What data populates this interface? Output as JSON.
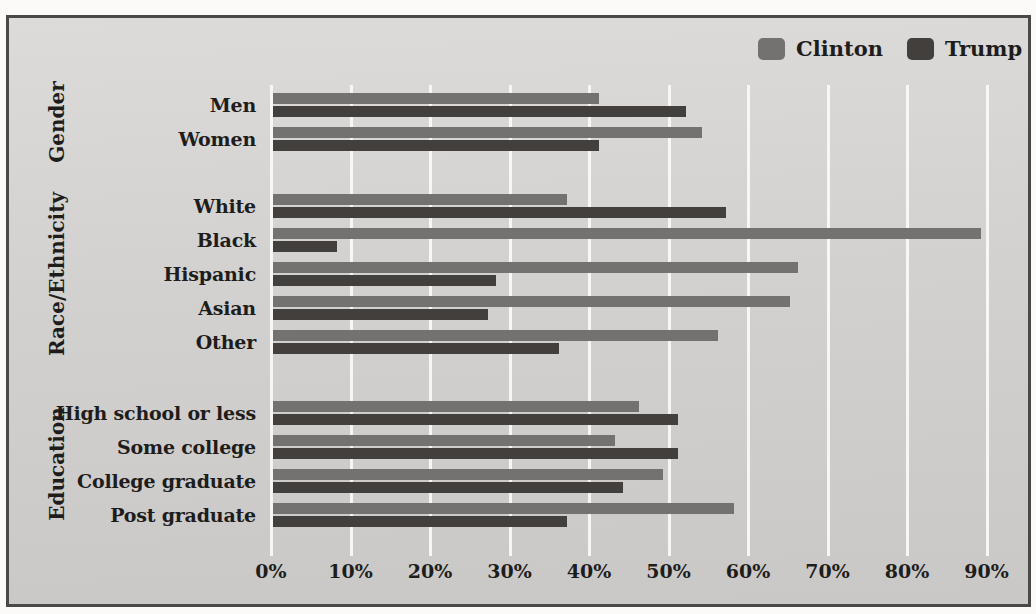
{
  "figure": {
    "legend": {
      "items": [
        {
          "label": "Clinton",
          "color": "#737270"
        },
        {
          "label": "Trump",
          "color": "#423F3C"
        }
      ]
    },
    "chart_data": {
      "type": "bar",
      "orientation": "horizontal",
      "title": "",
      "xlabel": "",
      "ylabel": "",
      "xlim": [
        0,
        90
      ],
      "xticks": [
        "0%",
        "10%",
        "20%",
        "30%",
        "40%",
        "50%",
        "60%",
        "70%",
        "80%",
        "90%"
      ],
      "grid": "vertical white gridlines every 10%",
      "legend_position": "top-right",
      "bar_colors": {
        "Clinton": "#737270",
        "Trump": "#423F3C"
      },
      "groups": [
        {
          "category": "Gender",
          "rows": [
            {
              "label": "Men",
              "clinton": 41,
              "trump": 52
            },
            {
              "label": "Women",
              "clinton": 54,
              "trump": 41
            }
          ]
        },
        {
          "category": "Race/Ethnicity",
          "rows": [
            {
              "label": "White",
              "clinton": 37,
              "trump": 57
            },
            {
              "label": "Black",
              "clinton": 89,
              "trump": 8
            },
            {
              "label": "Hispanic",
              "clinton": 66,
              "trump": 28
            },
            {
              "label": "Asian",
              "clinton": 65,
              "trump": 27
            },
            {
              "label": "Other",
              "clinton": 56,
              "trump": 36
            }
          ]
        },
        {
          "category": "Education",
          "rows": [
            {
              "label": "High school or less",
              "clinton": 46,
              "trump": 51
            },
            {
              "label": "Some college",
              "clinton": 43,
              "trump": 51
            },
            {
              "label": "College graduate",
              "clinton": 49,
              "trump": 44
            },
            {
              "label": "Post graduate",
              "clinton": 58,
              "trump": 37
            }
          ]
        }
      ],
      "series": [
        {
          "name": "Clinton",
          "values": [
            41,
            54,
            37,
            89,
            66,
            65,
            56,
            46,
            43,
            49,
            58
          ]
        },
        {
          "name": "Trump",
          "values": [
            52,
            41,
            57,
            8,
            28,
            27,
            36,
            51,
            51,
            44,
            37
          ]
        }
      ]
    }
  }
}
